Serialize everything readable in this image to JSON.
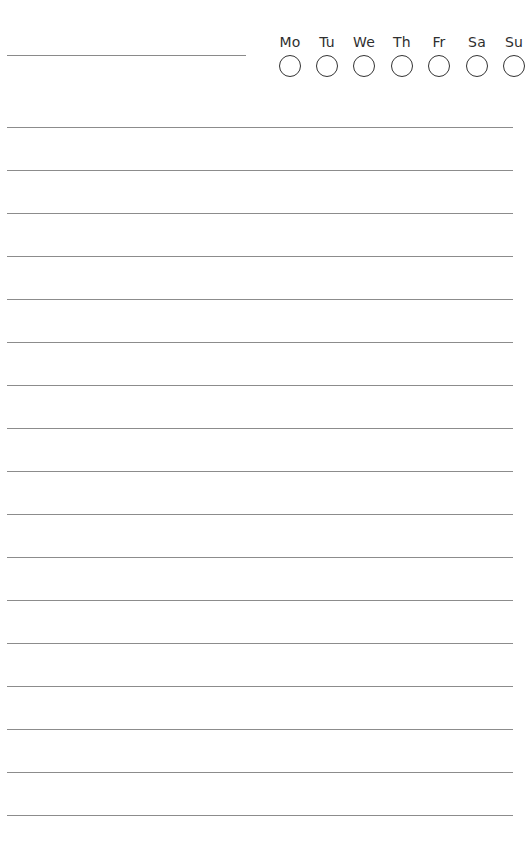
{
  "page": {
    "background": "#ffffff",
    "line_color": "#8c8c8c"
  },
  "header": {
    "title_line": ""
  },
  "habit_tracker": {
    "days": [
      {
        "label": "Mo",
        "checked": false
      },
      {
        "label": "Tu",
        "checked": false
      },
      {
        "label": "We",
        "checked": false
      },
      {
        "label": "Th",
        "checked": false
      },
      {
        "label": "Fr",
        "checked": false
      },
      {
        "label": "Sa",
        "checked": false
      },
      {
        "label": "Su",
        "checked": false
      }
    ]
  },
  "ruled_lines": {
    "count": 17,
    "first_y": 127,
    "spacing": 43
  }
}
